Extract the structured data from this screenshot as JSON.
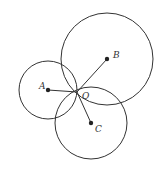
{
  "diagram": {
    "stroke_color": "#333333",
    "points": {
      "A": {
        "label": "A",
        "x": 48,
        "y": 90
      },
      "B": {
        "label": "B",
        "x": 107,
        "y": 59
      },
      "C": {
        "label": "C",
        "x": 91,
        "y": 123
      },
      "O": {
        "label": "O",
        "x": 77,
        "y": 92
      }
    },
    "circles": [
      {
        "center": "A",
        "r": 29
      },
      {
        "center": "B",
        "r": 46
      },
      {
        "center": "C",
        "r": 36
      }
    ],
    "segments": [
      [
        "A",
        "O"
      ],
      [
        "B",
        "O"
      ],
      [
        "C",
        "O"
      ]
    ]
  }
}
